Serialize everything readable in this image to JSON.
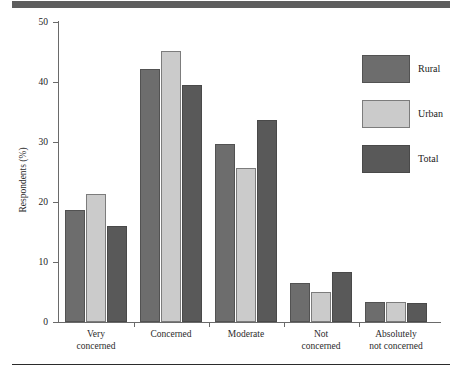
{
  "figure": {
    "background": "#ffffff",
    "banner_color": "#5e5e5e",
    "rule_color": "#2b2b2b"
  },
  "chart_data": {
    "type": "bar",
    "title": "",
    "xlabel": "",
    "ylabel": "Respondents (%)",
    "ylim": [
      0,
      50
    ],
    "yticks": [
      0,
      10,
      20,
      30,
      40,
      50
    ],
    "ytick_labels": [
      "0",
      "10",
      "20",
      "30",
      "40",
      "50"
    ],
    "grid": false,
    "legend_position": "right",
    "categories": [
      "Very\nconcerned",
      "Concerned",
      "Moderate",
      "Not\nconcerned",
      "Absolutely\nnot concerned"
    ],
    "category_lines": [
      [
        "Very",
        "concerned"
      ],
      [
        "Concerned",
        ""
      ],
      [
        "Moderate",
        ""
      ],
      [
        "Not",
        "concerned"
      ],
      [
        "Absolutely",
        "not concerned"
      ]
    ],
    "series": [
      {
        "name": "Rural",
        "color": "#6d6d6d",
        "values": [
          18.7,
          42.2,
          29.7,
          6.5,
          3.3
        ]
      },
      {
        "name": "Urban",
        "color": "#cbcbcb",
        "values": [
          21.3,
          45.2,
          25.7,
          5.0,
          3.4
        ]
      },
      {
        "name": "Total",
        "color": "#595959",
        "values": [
          16.0,
          39.5,
          33.7,
          8.3,
          3.2
        ]
      }
    ]
  },
  "legend": {
    "items": [
      {
        "label": "Rural",
        "color": "#6d6d6d"
      },
      {
        "label": "Urban",
        "color": "#cbcbcb"
      },
      {
        "label": "Total",
        "color": "#595959"
      }
    ]
  }
}
